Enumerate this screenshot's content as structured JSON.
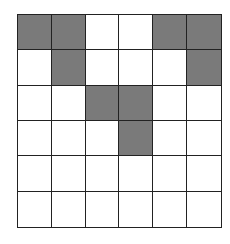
{
  "grid": {
    "rows": 6,
    "cols": 6,
    "fill_color": "#7a7a7a",
    "empty_color": "#ffffff",
    "line_color": "#222222",
    "cells": [
      [
        1,
        1,
        0,
        0,
        1,
        1
      ],
      [
        0,
        1,
        0,
        0,
        0,
        1
      ],
      [
        0,
        0,
        1,
        1,
        0,
        0
      ],
      [
        0,
        0,
        0,
        1,
        0,
        0
      ],
      [
        0,
        0,
        0,
        0,
        0,
        0
      ],
      [
        0,
        0,
        0,
        0,
        0,
        0
      ]
    ]
  }
}
